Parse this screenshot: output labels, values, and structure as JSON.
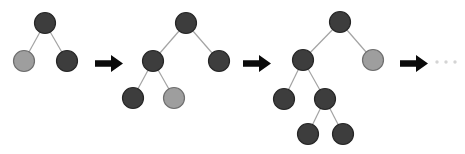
{
  "diagram": {
    "colors": {
      "background": "#ffffff",
      "node_dark_fill": "#3d3d3d",
      "node_dark_stroke": "#262626",
      "node_light_fill": "#9e9e9e",
      "node_light_stroke": "#6e6e6e",
      "edge": "#a3a3a3",
      "arrow": "#0a0a0a",
      "ellipsis": "#d4d4d4"
    },
    "node_radius": 10.5,
    "trees": [
      {
        "name": "binary-tree-1",
        "nodes": [
          {
            "id": "root",
            "x": 45,
            "y": 23,
            "shade": "dark"
          },
          {
            "id": "L",
            "x": 24,
            "y": 61,
            "shade": "light"
          },
          {
            "id": "R",
            "x": 67,
            "y": 61,
            "shade": "dark"
          }
        ],
        "edges": [
          [
            "root",
            "L"
          ],
          [
            "root",
            "R"
          ]
        ]
      },
      {
        "name": "binary-tree-2",
        "nodes": [
          {
            "id": "root",
            "x": 186,
            "y": 23,
            "shade": "dark"
          },
          {
            "id": "L",
            "x": 153,
            "y": 61,
            "shade": "dark"
          },
          {
            "id": "R",
            "x": 219,
            "y": 61,
            "shade": "dark"
          },
          {
            "id": "LL",
            "x": 133,
            "y": 98,
            "shade": "dark"
          },
          {
            "id": "LR",
            "x": 174,
            "y": 98,
            "shade": "light"
          }
        ],
        "edges": [
          [
            "root",
            "L"
          ],
          [
            "root",
            "R"
          ],
          [
            "L",
            "LL"
          ],
          [
            "L",
            "LR"
          ]
        ]
      },
      {
        "name": "binary-tree-3",
        "nodes": [
          {
            "id": "root",
            "x": 340,
            "y": 22,
            "shade": "dark"
          },
          {
            "id": "L",
            "x": 303,
            "y": 60,
            "shade": "dark"
          },
          {
            "id": "R",
            "x": 373,
            "y": 60,
            "shade": "light"
          },
          {
            "id": "LL",
            "x": 284,
            "y": 99,
            "shade": "dark"
          },
          {
            "id": "LR",
            "x": 325,
            "y": 99,
            "shade": "dark"
          },
          {
            "id": "LRL",
            "x": 308,
            "y": 134,
            "shade": "dark"
          },
          {
            "id": "LRR",
            "x": 343,
            "y": 134,
            "shade": "dark"
          }
        ],
        "edges": [
          [
            "root",
            "L"
          ],
          [
            "root",
            "R"
          ],
          [
            "L",
            "LL"
          ],
          [
            "L",
            "LR"
          ],
          [
            "LR",
            "LRL"
          ],
          [
            "LR",
            "LRR"
          ]
        ]
      }
    ],
    "arrows": [
      {
        "x": 95,
        "y": 55
      },
      {
        "x": 243,
        "y": 55
      },
      {
        "x": 400,
        "y": 55
      }
    ],
    "arrow_shape": {
      "width": 28,
      "height": 17,
      "tail_length": 16,
      "tail_half_thickness": 3.2,
      "head_half_height": 8.5
    },
    "ellipsis": {
      "dots": [
        {
          "x": 437,
          "y": 62
        },
        {
          "x": 446,
          "y": 62
        },
        {
          "x": 455,
          "y": 62
        }
      ],
      "dot_radius": 1.7
    }
  }
}
